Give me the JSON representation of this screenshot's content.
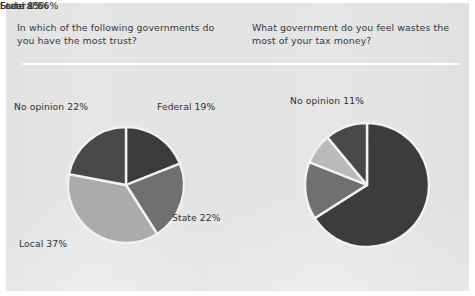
{
  "figure": {
    "background_color": "#e6e6e6",
    "page_color": "#ffffff",
    "divider_color": "#fdfdfd"
  },
  "questions": {
    "left": "In which of the following governments do you have the most trust?",
    "right": "What government do you feel wastes the most of your tax money?"
  },
  "palette": {
    "very_dark": "#3a3c3e",
    "dark": "#464849",
    "mid_gray": "#6e7072",
    "light_gray": "#a9abac",
    "lighter_gray": "#b9babb",
    "slice_border": "#f2f2f2",
    "label_text": "#2e3134",
    "question_text": "#35393c"
  },
  "chart_data": [
    {
      "type": "pie",
      "title": "In which of the following governments do you have the most trust?",
      "id": "trust",
      "start_angle_deg": 0,
      "direction": "clockwise",
      "center": [
        126,
        185
      ],
      "radius": 58,
      "categories": [
        "Federal",
        "State",
        "Local",
        "No opinion"
      ],
      "values": [
        19,
        22,
        37,
        22
      ],
      "unit": "%",
      "labels": [
        "Federal 19%",
        "State 22%",
        "Local 37%",
        "No opinion 22%"
      ],
      "colors": [
        "#3a3c3e",
        "#6e7072",
        "#a9abac",
        "#464849"
      ],
      "legend": "none",
      "grid": false
    },
    {
      "type": "pie",
      "title": "What government do you feel wastes the most of your tax money?",
      "id": "waste",
      "start_angle_deg": 0,
      "direction": "clockwise",
      "center": [
        367,
        185
      ],
      "radius": 62,
      "categories": [
        "Federal",
        "State",
        "Local",
        "No opinion"
      ],
      "values": [
        66,
        15,
        8,
        11
      ],
      "unit": "%",
      "labels": [
        "Federal 66%",
        "State 15%",
        "Local 8%",
        "No opinion 11%"
      ],
      "colors": [
        "#3a3c3e",
        "#6e7072",
        "#b9babb",
        "#464849"
      ],
      "legend": "none",
      "grid": false
    }
  ],
  "labels": {
    "left": {
      "federal": "Federal 19%",
      "state": "State 22%",
      "local": "Local 37%",
      "no_opinion": "No opinion 22%"
    },
    "right": {
      "federal": "Federal 66%",
      "state": "State 15%",
      "local": "Local 8%",
      "no_opinion": "No opinion 11%"
    }
  }
}
